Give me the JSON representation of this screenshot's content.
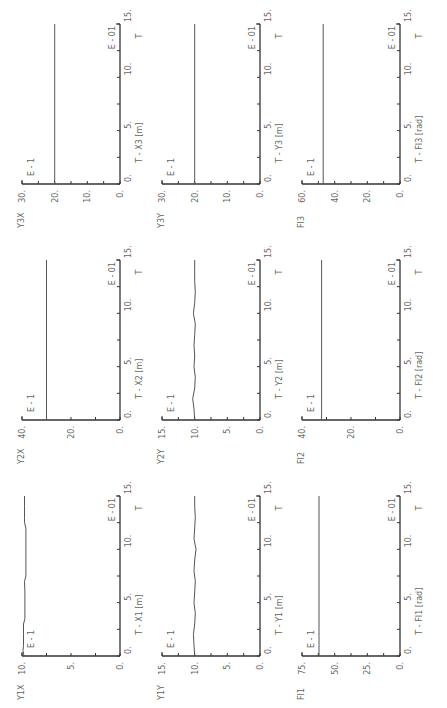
{
  "figure": {
    "rotation_deg": -90,
    "time_axis": {
      "ticks": [
        "0.",
        "5.",
        "10.",
        "15."
      ],
      "exponent": "E - 01",
      "label": "T"
    },
    "y_exponent": "E - 1"
  },
  "chart_data": [
    {
      "type": "line",
      "id": "Y1X",
      "title": "T - X1",
      "unit": "[m]",
      "xlabel": "T",
      "x_exponent": "E - 01",
      "y_exponent": "E - 1",
      "ylabel": "Y1X",
      "xlim": [
        0,
        15
      ],
      "ylim": [
        0,
        10
      ],
      "yticks": [
        "0.",
        "5.",
        "10."
      ],
      "x": [
        0,
        0.5,
        1,
        2,
        3,
        3.5,
        4,
        5,
        6,
        7,
        7.5,
        8,
        9,
        10,
        11,
        12,
        12.5,
        13,
        14,
        15
      ],
      "values": [
        9.8,
        9.9,
        9.85,
        9.85,
        9.85,
        9.7,
        9.7,
        9.7,
        9.7,
        9.75,
        9.6,
        9.6,
        9.6,
        9.6,
        9.6,
        9.6,
        9.75,
        9.75,
        9.75,
        9.75
      ]
    },
    {
      "type": "line",
      "id": "Y2X",
      "title": "T - X2",
      "unit": "[m]",
      "xlabel": "T",
      "x_exponent": "E - 01",
      "y_exponent": "E - 1",
      "ylabel": "Y2X",
      "xlim": [
        0,
        15
      ],
      "ylim": [
        0,
        40
      ],
      "yticks": [
        "0.",
        "20.",
        "40."
      ],
      "x": [
        0,
        15
      ],
      "values": [
        30,
        30
      ]
    },
    {
      "type": "line",
      "id": "Y3X",
      "title": "T - X3",
      "unit": "[m]",
      "xlabel": "T",
      "x_exponent": "E - 01",
      "y_exponent": "E - 1",
      "ylabel": "Y3X",
      "xlim": [
        0,
        15
      ],
      "ylim": [
        0,
        30
      ],
      "yticks": [
        "0.",
        "10.",
        "20.",
        "30."
      ],
      "x": [
        0,
        15
      ],
      "values": [
        20,
        20
      ]
    },
    {
      "type": "line",
      "id": "Y1Y",
      "title": "T - Y1",
      "unit": "[m]",
      "xlabel": "T",
      "x_exponent": "E - 01",
      "y_exponent": "E - 1",
      "ylabel": "Y1Y",
      "xlim": [
        0,
        15
      ],
      "ylim": [
        0,
        15
      ],
      "yticks": [
        "0.",
        "5.",
        "10.",
        "15."
      ],
      "x": [
        0,
        1,
        2,
        3,
        4,
        5,
        6,
        7,
        8,
        9,
        10,
        11,
        12,
        13,
        14,
        15
      ],
      "values": [
        10,
        10.1,
        10.2,
        10.0,
        9.9,
        10.1,
        10.0,
        9.9,
        10.1,
        10.0,
        9.8,
        10.1,
        10.0,
        9.9,
        10.0,
        10.0
      ]
    },
    {
      "type": "line",
      "id": "Y2Y",
      "title": "T - Y2",
      "unit": "[m]",
      "xlabel": "T",
      "x_exponent": "E - 01",
      "y_exponent": "E - 1",
      "ylabel": "Y2Y",
      "xlim": [
        0,
        15
      ],
      "ylim": [
        0,
        15
      ],
      "yticks": [
        "0.",
        "5.",
        "10.",
        "15."
      ],
      "x": [
        0,
        1,
        2,
        3,
        4,
        5,
        6,
        7,
        8,
        9,
        10,
        11,
        12,
        13,
        14,
        15
      ],
      "values": [
        10,
        10.1,
        10.3,
        10.0,
        9.9,
        10.1,
        10.0,
        10.1,
        10.0,
        9.9,
        10.2,
        10.0,
        9.9,
        10.0,
        10.0,
        10.0
      ]
    },
    {
      "type": "line",
      "id": "Y3Y",
      "title": "T - Y3",
      "unit": "[m]",
      "xlabel": "T",
      "x_exponent": "E - 01",
      "y_exponent": "E - 1",
      "ylabel": "Y3Y",
      "xlim": [
        0,
        15
      ],
      "ylim": [
        0,
        30
      ],
      "yticks": [
        "0.",
        "10.",
        "20.",
        "30."
      ],
      "x": [
        0,
        15
      ],
      "values": [
        20,
        20
      ]
    },
    {
      "type": "line",
      "id": "FI1",
      "title": "T - FI1",
      "unit": "[rad]",
      "xlabel": "T",
      "x_exponent": "E - 01",
      "y_exponent": "E - 1",
      "ylabel": "FI1",
      "xlim": [
        0,
        15
      ],
      "ylim": [
        0,
        75
      ],
      "yticks": [
        "0.",
        "25.",
        "50.",
        "75."
      ],
      "x": [
        0,
        15
      ],
      "values": [
        62,
        62
      ]
    },
    {
      "type": "line",
      "id": "FI2",
      "title": "T - FI2",
      "unit": "[rad]",
      "xlabel": "T",
      "x_exponent": "E - 01",
      "y_exponent": "E - 1",
      "ylabel": "FI2",
      "xlim": [
        0,
        15
      ],
      "ylim": [
        0,
        40
      ],
      "yticks": [
        "0.",
        "20.",
        "40."
      ],
      "x": [
        0,
        15
      ],
      "values": [
        32,
        32
      ]
    },
    {
      "type": "line",
      "id": "FI3",
      "title": "T - FI3",
      "unit": "[rad]",
      "xlabel": "T",
      "x_exponent": "E - 01",
      "y_exponent": "E - 1",
      "ylabel": "FI3",
      "xlim": [
        0,
        15
      ],
      "ylim": [
        0,
        60
      ],
      "yticks": [
        "0.",
        "20.",
        "40.",
        "60."
      ],
      "x": [
        0,
        15
      ],
      "values": [
        47,
        47
      ]
    }
  ],
  "colors": {
    "axis": "#333333",
    "line": "#555555",
    "text": "#666666"
  }
}
